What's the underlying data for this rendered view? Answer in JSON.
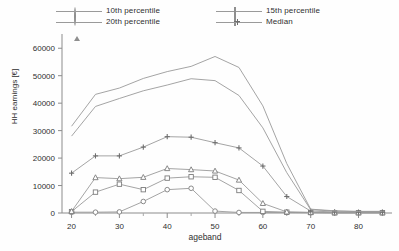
{
  "chart_data": {
    "type": "line",
    "title": "",
    "xlabel": "ageband",
    "ylabel": "HH earnings [€]",
    "xlim": [
      18,
      87
    ],
    "ylim": [
      0,
      63000
    ],
    "xticks": [
      20,
      30,
      40,
      50,
      60,
      70,
      80
    ],
    "xticks_minor": [
      25,
      35,
      45,
      55,
      65,
      75,
      85
    ],
    "yticks": [
      0,
      10000,
      20000,
      30000,
      40000,
      50000,
      60000
    ],
    "grid": false,
    "legend_position": "top",
    "x": [
      20,
      25,
      30,
      35,
      40,
      45,
      50,
      55,
      60,
      65,
      70,
      75,
      80,
      85
    ],
    "series": [
      {
        "name": "10th percentile",
        "marker": "circle",
        "in_legend": true,
        "values": [
          300,
          300,
          400,
          4200,
          8500,
          9000,
          700,
          200,
          200,
          200,
          100,
          100,
          100,
          100
        ]
      },
      {
        "name": "15th percentile",
        "marker": "square",
        "in_legend": true,
        "values": [
          500,
          7600,
          10500,
          8500,
          12700,
          13200,
          13000,
          8200,
          600,
          300,
          200,
          100,
          100,
          100
        ]
      },
      {
        "name": "20th percentile",
        "marker": "triangle",
        "in_legend": true,
        "values": [
          600,
          12900,
          12500,
          13000,
          16200,
          15800,
          15300,
          12000,
          3500,
          400,
          200,
          100,
          100,
          100
        ]
      },
      {
        "name": "Median",
        "marker": "plus",
        "in_legend": true,
        "values": [
          14500,
          20800,
          20800,
          24000,
          27800,
          27600,
          25600,
          23700,
          17100,
          6000,
          700,
          400,
          300,
          300
        ]
      },
      {
        "name": "upper-band-1",
        "marker": "none",
        "in_legend": false,
        "values": [
          28000,
          38800,
          41700,
          44500,
          46600,
          48900,
          48200,
          42800,
          31000,
          14700,
          1200,
          700,
          500,
          500
        ]
      },
      {
        "name": "upper-band-2",
        "marker": "none",
        "in_legend": false,
        "values": [
          31600,
          43200,
          45500,
          49000,
          51500,
          53400,
          57000,
          53000,
          39000,
          18000,
          1400,
          800,
          600,
          600
        ]
      }
    ]
  },
  "legend": {
    "items": [
      {
        "label": "10th percentile",
        "marker": "circle"
      },
      {
        "label": "20th percentile",
        "marker": "triangle"
      },
      {
        "label": "15th percentile",
        "marker": "square"
      },
      {
        "label": "Median",
        "marker": "plus"
      }
    ]
  },
  "axes": {
    "ylabel": "HH earnings [€]",
    "xlabel": "ageband",
    "ytick_labels": [
      "0",
      "10000",
      "20000",
      "30000",
      "40000",
      "50000",
      "60000"
    ],
    "xtick_labels": [
      "20",
      "30",
      "40",
      "50",
      "60",
      "70",
      "80"
    ]
  },
  "style": {
    "line_color": "#9a9a9a",
    "text_color": "#2f2f2f",
    "background": "#fefefe"
  }
}
